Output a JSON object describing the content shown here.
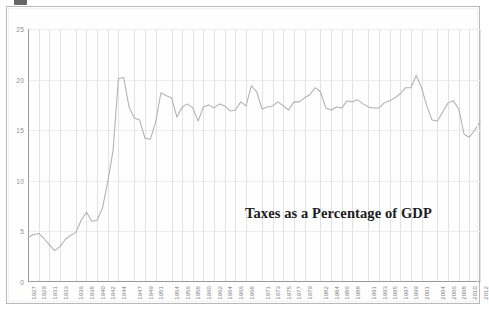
{
  "figure": {
    "annotation": "Taxes as a Percentage of GDP",
    "line_color": "#b0b0b0",
    "grid_color": "#e2e2e2",
    "axis_color": "#9a9a9a",
    "annotation_color": "#1d1d1d",
    "background": "#ffffff"
  },
  "chart_data": {
    "type": "line",
    "title": "Taxes as a Percentage of GDP",
    "xlabel": "",
    "ylabel": "",
    "ylim": [
      0,
      25
    ],
    "xlim": [
      1927,
      2012
    ],
    "grid": true,
    "legend": "none",
    "ytick_labels": [
      "0",
      "5",
      "10",
      "15",
      "20",
      "25"
    ],
    "ytick_values": [
      0,
      5,
      10,
      15,
      20,
      25
    ],
    "xtick_labels": [
      "1927",
      "1929",
      "1931",
      "1933",
      "1936",
      "1938",
      "1940",
      "1942",
      "1944",
      "1947",
      "1949",
      "1951",
      "1954",
      "1956",
      "1958",
      "1960",
      "1962",
      "1964",
      "1966",
      "1968",
      "1971",
      "1973",
      "1975",
      "1977",
      "1979",
      "1982",
      "1984",
      "1986",
      "1988",
      "1991",
      "1993",
      "1995",
      "1997",
      "1999",
      "2001",
      "2004",
      "2006",
      "2008",
      "2010",
      "2012"
    ],
    "annotations": [
      {
        "text": "Taxes as a Percentage of GDP",
        "x": 1988,
        "y": 6.5
      }
    ],
    "series": [
      {
        "name": "Taxes as a Percentage of GDP",
        "x": [
          1927,
          1928,
          1929,
          1930,
          1931,
          1932,
          1933,
          1934,
          1935,
          1936,
          1937,
          1938,
          1939,
          1940,
          1941,
          1942,
          1943,
          1944,
          1945,
          1946,
          1947,
          1948,
          1949,
          1950,
          1951,
          1952,
          1953,
          1954,
          1955,
          1956,
          1957,
          1958,
          1959,
          1960,
          1961,
          1962,
          1963,
          1964,
          1965,
          1966,
          1967,
          1968,
          1969,
          1970,
          1971,
          1972,
          1973,
          1974,
          1975,
          1976,
          1977,
          1978,
          1979,
          1980,
          1981,
          1982,
          1983,
          1984,
          1985,
          1986,
          1987,
          1988,
          1989,
          1990,
          1991,
          1992,
          1993,
          1994,
          1995,
          1996,
          1997,
          1998,
          1999,
          2000,
          2001,
          2002,
          2003,
          2004,
          2005,
          2006,
          2007,
          2008,
          2009,
          2010,
          2011,
          2012
        ],
        "values": [
          4.4,
          4.7,
          4.8,
          4.3,
          3.7,
          3.1,
          3.5,
          4.2,
          4.6,
          4.9,
          6.1,
          6.9,
          6.0,
          6.1,
          7.3,
          9.9,
          13.0,
          20.1,
          20.2,
          17.3,
          16.2,
          16.0,
          14.2,
          14.1,
          15.8,
          18.7,
          18.4,
          18.2,
          16.3,
          17.3,
          17.6,
          17.2,
          15.9,
          17.3,
          17.5,
          17.2,
          17.6,
          17.4,
          16.9,
          17.0,
          17.8,
          17.4,
          19.4,
          18.8,
          17.1,
          17.3,
          17.4,
          17.8,
          17.4,
          17.0,
          17.8,
          17.8,
          18.2,
          18.5,
          19.2,
          18.8,
          17.2,
          17.0,
          17.3,
          17.2,
          17.9,
          17.8,
          18.0,
          17.6,
          17.3,
          17.2,
          17.2,
          17.7,
          17.9,
          18.2,
          18.6,
          19.2,
          19.2,
          20.4,
          19.2,
          17.4,
          16.0,
          15.9,
          16.8,
          17.7,
          17.9,
          17.1,
          14.6,
          14.3,
          15.0,
          15.8
        ]
      }
    ]
  }
}
